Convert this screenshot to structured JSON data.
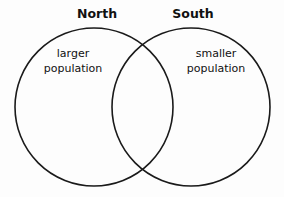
{
  "diagram": {
    "type": "venn",
    "sets": [
      {
        "title": "North",
        "description": [
          "larger",
          "population"
        ]
      },
      {
        "title": "South",
        "description": [
          "smaller",
          "population"
        ]
      }
    ],
    "stroke_color": "#1a1a1a",
    "background": "#fdfdfd"
  }
}
